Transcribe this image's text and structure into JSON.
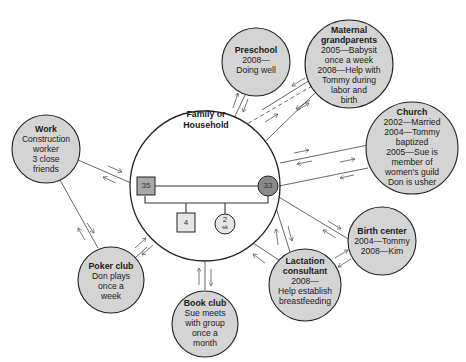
{
  "diagram": {
    "type": "ecomap",
    "household": {
      "title_lines": [
        "Family or",
        "Household"
      ],
      "members": [
        {
          "id": "father",
          "shape": "square",
          "label": "35",
          "shaded": true
        },
        {
          "id": "mother",
          "shape": "circle",
          "label": "33",
          "shaded": true
        },
        {
          "id": "son",
          "shape": "square",
          "label": "4",
          "shaded": false
        },
        {
          "id": "infant",
          "shape": "circle",
          "label": "2",
          "sublabel": "wk",
          "shaded": false
        }
      ]
    },
    "nodes": [
      {
        "id": "work",
        "title": "Work",
        "lines": [
          "Construction",
          "worker",
          "3 close",
          "friends"
        ]
      },
      {
        "id": "preschool",
        "title": "Preschool",
        "lines": [
          "2008—",
          "Doing well"
        ]
      },
      {
        "id": "maternal-grandparents",
        "title_lines": [
          "Maternal",
          "grandparents"
        ],
        "lines": [
          "2005—Babysit",
          "once a week",
          "2008—Help with",
          "Tommy during",
          "labor and",
          "birth"
        ]
      },
      {
        "id": "church",
        "title": "Church",
        "lines": [
          "2002—Married",
          "2004—Tommy",
          "baptized",
          "2005—Sue is",
          "member of",
          "women's guild",
          "Don is usher"
        ]
      },
      {
        "id": "birth-center",
        "title": "Birth center",
        "lines": [
          "2004—Tommy",
          "2008—Kim"
        ]
      },
      {
        "id": "lactation-consultant",
        "title_lines": [
          "Lactation",
          "consultant"
        ],
        "lines": [
          "2008—",
          "Help establish",
          "breastfeeding"
        ]
      },
      {
        "id": "book-club",
        "title": "Book club",
        "lines": [
          "Sue meets",
          "with group",
          "once a",
          "month"
        ]
      },
      {
        "id": "poker-club",
        "title": "Poker club",
        "lines": [
          "Don plays",
          "once a",
          "week"
        ]
      }
    ],
    "colors": {
      "node_fill": "#d4d4d4",
      "father_fill": "#a8a8a8",
      "mother_fill": "#8a8a8a",
      "member_fill": "#e6e6e6",
      "stroke": "#222222",
      "line": "#555555"
    }
  }
}
